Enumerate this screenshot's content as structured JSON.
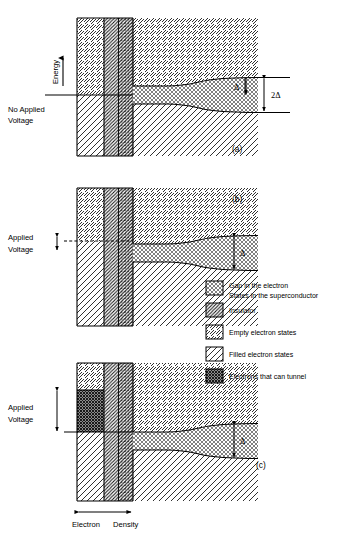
{
  "figure": {
    "title_implicit": "Superconducting tunnel junction energy band diagram",
    "axis": {
      "energy_label": "Energy",
      "density_label_left": "Electron",
      "density_label_right": "Density"
    },
    "panels": [
      {
        "id": "a",
        "tag": "(a)",
        "left_label_line1": "No  Applied",
        "left_label_line2": "Voltage",
        "gap_markers": [
          {
            "name": "delta",
            "text": "Δ"
          },
          {
            "name": "two-delta",
            "text": "2Δ"
          }
        ]
      },
      {
        "id": "b",
        "tag": "(b)",
        "left_label_line1": "Applied",
        "left_label_line2": "Voltage",
        "gap_markers": [
          {
            "name": "delta",
            "text": "Δ"
          }
        ]
      },
      {
        "id": "c",
        "tag": "(c)",
        "left_label_line1": "Applied",
        "left_label_line2": "Voltage",
        "gap_markers": [
          {
            "name": "delta",
            "text": "Δ"
          }
        ]
      }
    ],
    "legend": [
      {
        "key": "gap-in-electron-states",
        "pattern": "cross-hatch-light",
        "line1": "Gap in the electron",
        "line2": "States in the superconductor"
      },
      {
        "key": "insulator",
        "pattern": "dense-back-hatch",
        "line1": "Insulator",
        "line2": ""
      },
      {
        "key": "empty-electron-states",
        "pattern": "sparse-fwd-hatch",
        "line1": "Empty  electron  states",
        "line2": ""
      },
      {
        "key": "filled-electron-states",
        "pattern": "sparse-back-hatch",
        "line1": "Filled  electron  states",
        "line2": ""
      },
      {
        "key": "electrons-that-can-tunnel",
        "pattern": "dark-cross-hatch",
        "line1": "Electrons  that  can  tunnel",
        "line2": ""
      }
    ],
    "colors": {
      "stroke": "#000000",
      "background": "#ffffff",
      "gap_fill": "#d8d8d8",
      "tunnel_fill": "#6e6e6e"
    }
  }
}
